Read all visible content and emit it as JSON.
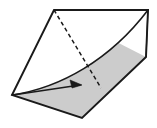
{
  "figure": {
    "canvas": {
      "width": 157,
      "height": 128
    },
    "colors": {
      "background": "#ffffff",
      "fill_shaded": "#cccccc",
      "fill_unshaded": "#ffffff",
      "stroke": "#1a1a1a",
      "stroke_thin": "#2a2a2a"
    },
    "stroke_widths": {
      "outline": 1.9,
      "thin": 1.2,
      "dashed": 1.5,
      "arrow": 1.6
    },
    "dash_pattern": "4,3",
    "vertices": {
      "apex_top": {
        "x": 54,
        "y": 10,
        "label": "A"
      },
      "top_right": {
        "x": 148,
        "y": 10,
        "label": "B"
      },
      "right": {
        "x": 146,
        "y": 57,
        "label": "C"
      },
      "bottom": {
        "x": 82,
        "y": 118,
        "label": "D"
      },
      "left": {
        "x": 12,
        "y": 95,
        "label": "E"
      },
      "crease_foot": {
        "x": 101,
        "y": 88,
        "label": "F"
      }
    },
    "paths": {
      "outer_quad": "54,10 148,10 146,57 82,118 12,95",
      "shaded_face": "54,10 12,95 82,118 146,57",
      "back_edge_thin": "54,10 148,10 146,57",
      "crease_dashed": "54,10 101,88",
      "arc_curve": "M 12,95 C 60,88 110,60 148,10",
      "arrow_line": "M 13,95 L 80,85",
      "arrow_head": "82,85 70,80 72,88"
    },
    "elements": [
      {
        "name": "shaded-face",
        "type": "polygon",
        "filled": true
      },
      {
        "name": "unshaded-face",
        "type": "polygon",
        "filled": false
      },
      {
        "name": "fold-crease",
        "type": "dashed-line"
      },
      {
        "name": "arc-curve",
        "type": "curve"
      },
      {
        "name": "direction-arrow",
        "type": "arrow"
      }
    ]
  }
}
